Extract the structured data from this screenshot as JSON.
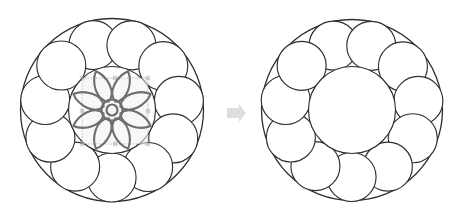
{
  "figure": {
    "background_color": "#ffffff",
    "width": 457,
    "height": 220,
    "stroke_color": "#2f2f2f",
    "flower_color": "#6e6e6e",
    "arrow_color": "#dedede",
    "selection_fill": "#f2f2f2",
    "selection_stroke": "#9a9a9a"
  },
  "chart_data": {
    "type": "diagram",
    "panels": [
      {
        "name": "before",
        "label": "Ring of circles with central flower motif",
        "outer_circle": {
          "cx": 112,
          "cy": 110,
          "r": 91.5
        },
        "inner_circle": {
          "cx": 112,
          "cy": 110,
          "r": 43.5
        },
        "ring_circle_count": 11,
        "ring_circle_radius": 24.5,
        "ring_orbit_radius": 67.5,
        "ring_start_angle_deg": -106,
        "ornament": {
          "type": "flower",
          "petal_count": 8,
          "petal_length": 33,
          "petal_width": 11.5,
          "hub_outer_radius": 10.5,
          "hub_inner_radius": 5.5,
          "rotation_deg": 22.5,
          "selected": true,
          "selection_box": {
            "x": 82,
            "y": 78,
            "width": 66,
            "height": 66
          }
        }
      },
      {
        "name": "after",
        "label": "Ring of circles with empty centre",
        "outer_circle": {
          "cx": 352,
          "cy": 110,
          "r": 90.5
        },
        "inner_circle": {
          "cx": 352,
          "cy": 110,
          "r": 43.5
        },
        "ring_circle_count": 11,
        "ring_circle_radius": 24.5,
        "ring_orbit_radius": 67.0,
        "ring_start_angle_deg": -106,
        "ornament": null
      }
    ],
    "connector": {
      "type": "block-arrow",
      "direction": "right",
      "x": 227,
      "y": 104,
      "width": 19,
      "height": 18,
      "color": "#dedede"
    }
  }
}
